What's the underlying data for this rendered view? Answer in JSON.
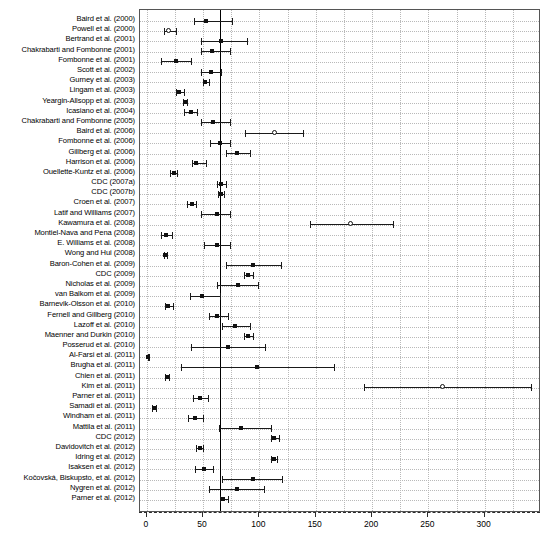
{
  "chart_data": {
    "type": "scatter",
    "title": "",
    "subtitle": "",
    "xlabel": "",
    "ylabel": "",
    "xlim": [
      -6,
      350
    ],
    "ylim": [
      0,
      46
    ],
    "grid": true,
    "legend": null,
    "reference_line": 65,
    "xticks": [
      0,
      50,
      100,
      150,
      200,
      250,
      300
    ],
    "xticklabels": [
      "0",
      "50",
      "100",
      "150",
      "200",
      "250",
      "300"
    ],
    "categories": [
      "Baird et al. (2000)",
      "Powell et al. (2000)",
      "Bertrand et al. (2001)",
      "Chakrabarti and Fombonne (2001)",
      "Fombonne et al. (2001)",
      "Scott et al. (2002)",
      "Gurney et al. (2003)",
      "Lingam et al. (2003)",
      "Yeargin-Allsopp et al. (2003)",
      "Icasiano et al. (2004)",
      "Chakrabarti and Fombonne (2005)",
      "Baird et al. (2006)",
      "Fombonne et al. (2006)",
      "Gillberg et al. (2006)",
      "Harrison et al. (2006)",
      "Ouellette-Kuntz et al. (2006)",
      "CDC (2007a)",
      "CDC (2007b)",
      "Croen et al. (2007)",
      "Latif and Williams (2007)",
      "Kawamura et al. (2008)",
      "Montiel-Nava and Pena (2008)",
      "E. Williams et al. (2008)",
      "Wong and Hui (2008)",
      "Baron-Cohen et al. (2009)",
      "CDC (2009)",
      "Nicholas et al. (2009)",
      "van Balkom et al. (2009)",
      "Barnevik-Olsson et al. (2010)",
      "Fernell and Gillberg (2010)",
      "Lazoff et al. (2010)",
      "Maenner and Durkin (2010)",
      "Posserud et al. (2010)",
      "Al-Farsi et al. (2011)",
      "Brugha et al. (2011)",
      "Chien et al. (2011)",
      "Kim et al. (2011)",
      "Parner et al. (2011)",
      "Samadi et al. (2011)",
      "Windham et al. (2011)",
      "Mattila et al. (2011)",
      "CDC (2012)",
      "Davidovitch et al. (2012)",
      "Idring et al. (2012)",
      "Isaksen et al. (2012)",
      "Kočovská, Biskupsto, et al. (2012)",
      "Nygren et al. (2012)",
      "Parner et al. (2012)"
    ],
    "points": [
      {
        "study": "Baird et al. (2000)",
        "estimate": 53.0,
        "ci_low": 42.0,
        "ci_high": 76.0,
        "marker": "square"
      },
      {
        "study": "Powell et al. (2000)",
        "estimate": 20.0,
        "ci_low": 15.0,
        "ci_high": 26.0,
        "marker": "circle"
      },
      {
        "study": "Bertrand et al. (2001)",
        "estimate": 66.0,
        "ci_low": 48.0,
        "ci_high": 89.0,
        "marker": "square"
      },
      {
        "study": "Chakrabarti and Fombonne (2001)",
        "estimate": 58.0,
        "ci_low": 48.0,
        "ci_high": 74.0,
        "marker": "square"
      },
      {
        "study": "Fombonne et al. (2001)",
        "estimate": 26.0,
        "ci_low": 13.0,
        "ci_high": 39.0,
        "marker": "square"
      },
      {
        "study": "Scott et al. (2002)",
        "estimate": 57.0,
        "ci_low": 48.0,
        "ci_high": 66.0,
        "marker": "square"
      },
      {
        "study": "Gurney et al. (2003)",
        "estimate": 52.0,
        "ci_low": 50.0,
        "ci_high": 55.0,
        "marker": "square"
      },
      {
        "study": "Lingam et al. (2003)",
        "estimate": 29.0,
        "ci_low": 26.0,
        "ci_high": 33.0,
        "marker": "square"
      },
      {
        "study": "Yeargin-Allsopp et al. (2003)",
        "estimate": 34.0,
        "ci_low": 32.0,
        "ci_high": 36.0,
        "marker": "square"
      },
      {
        "study": "Icasiano et al. (2004)",
        "estimate": 39.0,
        "ci_low": 33.0,
        "ci_high": 45.0,
        "marker": "square"
      },
      {
        "study": "Chakrabarti and Fombonne (2005)",
        "estimate": 59.0,
        "ci_low": 48.0,
        "ci_high": 74.0,
        "marker": "square"
      },
      {
        "study": "Baird et al. (2006)",
        "estimate": 114.0,
        "ci_low": 87.0,
        "ci_high": 139.0,
        "marker": "circle"
      },
      {
        "study": "Fombonne et al. (2006)",
        "estimate": 65.0,
        "ci_low": 56.0,
        "ci_high": 74.0,
        "marker": "square"
      },
      {
        "study": "Gillberg et al. (2006)",
        "estimate": 80.0,
        "ci_low": 70.0,
        "ci_high": 92.0,
        "marker": "square"
      },
      {
        "study": "Harrison et al. (2006)",
        "estimate": 44.0,
        "ci_low": 40.0,
        "ci_high": 53.0,
        "marker": "square"
      },
      {
        "study": "Ouellette-Kuntz et al. (2006)",
        "estimate": 24.0,
        "ci_low": 21.0,
        "ci_high": 27.0,
        "marker": "square"
      },
      {
        "study": "CDC (2007a)",
        "estimate": 66.0,
        "ci_low": 62.0,
        "ci_high": 70.0,
        "marker": "square"
      },
      {
        "study": "CDC (2007b)",
        "estimate": 66.0,
        "ci_low": 63.0,
        "ci_high": 69.0,
        "marker": "square"
      },
      {
        "study": "Croen et al. (2007)",
        "estimate": 40.0,
        "ci_low": 36.0,
        "ci_high": 44.0,
        "marker": "square"
      },
      {
        "study": "Latif and Williams (2007)",
        "estimate": 62.0,
        "ci_low": 48.0,
        "ci_high": 74.0,
        "marker": "square"
      },
      {
        "study": "Kawamura et al. (2008)",
        "estimate": 181.0,
        "ci_low": 145.0,
        "ci_high": 219.0,
        "marker": "circle"
      },
      {
        "study": "Montiel-Nava and Pena (2008)",
        "estimate": 17.0,
        "ci_low": 13.0,
        "ci_high": 22.0,
        "marker": "square"
      },
      {
        "study": "E. Williams et al. (2008)",
        "estimate": 62.0,
        "ci_low": 51.0,
        "ci_high": 74.0,
        "marker": "square"
      },
      {
        "study": "Wong and Hui (2008)",
        "estimate": 16.0,
        "ci_low": 15.0,
        "ci_high": 18.0,
        "marker": "square"
      },
      {
        "study": "Baron-Cohen et al. (2009)",
        "estimate": 94.0,
        "ci_low": 70.0,
        "ci_high": 119.0,
        "marker": "square"
      },
      {
        "study": "CDC (2009)",
        "estimate": 90.0,
        "ci_low": 86.0,
        "ci_high": 94.0,
        "marker": "square"
      },
      {
        "study": "Nicholas et al. (2009)",
        "estimate": 81.0,
        "ci_low": 62.0,
        "ci_high": 99.0,
        "marker": "square"
      },
      {
        "study": "van Balkom et al. (2009)",
        "estimate": 49.0,
        "ci_low": 38.0,
        "ci_high": 65.0,
        "marker": "square"
      },
      {
        "study": "Barnevik-Olsson et al. (2010)",
        "estimate": 19.0,
        "ci_low": 16.0,
        "ci_high": 23.0,
        "marker": "square"
      },
      {
        "study": "Fernell and Gillberg (2010)",
        "estimate": 62.0,
        "ci_low": 55.0,
        "ci_high": 72.0,
        "marker": "square"
      },
      {
        "study": "Lazoff et al. (2010)",
        "estimate": 78.0,
        "ci_low": 67.0,
        "ci_high": 92.0,
        "marker": "square"
      },
      {
        "study": "Maenner and Durkin (2010)",
        "estimate": 90.0,
        "ci_low": 86.0,
        "ci_high": 94.0,
        "marker": "square"
      },
      {
        "study": "Posserud et al. (2010)",
        "estimate": 72.0,
        "ci_low": 39.0,
        "ci_high": 105.0,
        "marker": "square"
      },
      {
        "study": "Al-Farsi et al. (2011)",
        "estimate": 1.4,
        "ci_low": 1.0,
        "ci_high": 2.0,
        "marker": "square"
      },
      {
        "study": "Brugha et al. (2011)",
        "estimate": 98.0,
        "ci_low": 30.0,
        "ci_high": 166.0,
        "marker": "square"
      },
      {
        "study": "Chien et al. (2011)",
        "estimate": 18.0,
        "ci_low": 16.0,
        "ci_high": 20.0,
        "marker": "square"
      },
      {
        "study": "Kim et al. (2011)",
        "estimate": 263.0,
        "ci_low": 193.0,
        "ci_high": 341.0,
        "marker": "circle"
      },
      {
        "study": "Parner et al. (2011)",
        "estimate": 47.0,
        "ci_low": 41.0,
        "ci_high": 54.0,
        "marker": "square"
      },
      {
        "study": "Samadi et al. (2011)",
        "estimate": 6.0,
        "ci_low": 5.0,
        "ci_high": 8.0,
        "marker": "square"
      },
      {
        "study": "Windham et al. (2011)",
        "estimate": 43.0,
        "ci_low": 37.0,
        "ci_high": 50.0,
        "marker": "square"
      },
      {
        "study": "Mattila et al. (2011)",
        "estimate": 84.0,
        "ci_low": 64.0,
        "ci_high": 110.0,
        "marker": "square"
      },
      {
        "study": "CDC (2012)",
        "estimate": 113.0,
        "ci_low": 110.0,
        "ci_high": 117.0,
        "marker": "square"
      },
      {
        "study": "Davidovitch et al. (2012)",
        "estimate": 47.0,
        "ci_low": 44.0,
        "ci_high": 50.0,
        "marker": "square"
      },
      {
        "study": "Idring et al. (2012)",
        "estimate": 113.0,
        "ci_low": 110.0,
        "ci_high": 116.0,
        "marker": "square"
      },
      {
        "study": "Isaksen et al. (2012)",
        "estimate": 51.0,
        "ci_low": 43.0,
        "ci_high": 59.0,
        "marker": "square"
      },
      {
        "study": "Kočovská, Biskupsto, et al. (2012)",
        "estimate": 94.0,
        "ci_low": 67.0,
        "ci_high": 120.0,
        "marker": "square"
      },
      {
        "study": "Nygren et al. (2012)",
        "estimate": 80.0,
        "ci_low": 55.0,
        "ci_high": 104.0,
        "marker": "square"
      },
      {
        "study": "Parner et al. (2012)",
        "estimate": 68.0,
        "ci_low": 65.0,
        "ci_high": 72.0,
        "marker": "square"
      }
    ]
  },
  "style": {
    "marker_color": "#111111",
    "line_color": "#1a1a1a",
    "grid_color": "#b9b9b9",
    "frame_color": "#555555",
    "background": "#ffffff"
  }
}
